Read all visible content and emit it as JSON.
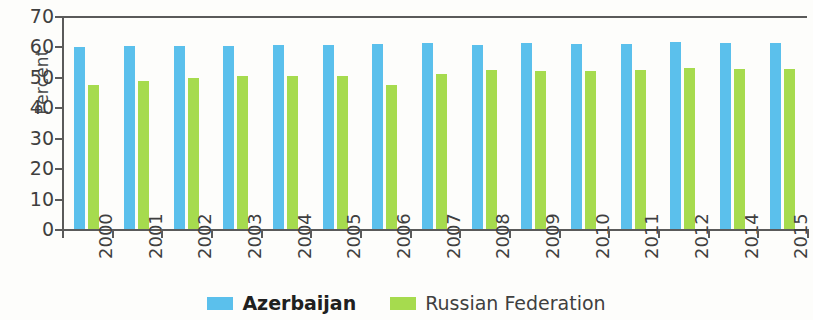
{
  "chart_data": {
    "type": "bar",
    "title": "",
    "xlabel": "",
    "ylabel": "Percent",
    "ylim": [
      0,
      70
    ],
    "yticks": [
      0,
      10,
      20,
      30,
      40,
      50,
      60,
      70
    ],
    "grid": false,
    "legend_position": "bottom-center",
    "categories": [
      "2000",
      "2001",
      "2002",
      "2003",
      "2004",
      "2005",
      "2006",
      "2007",
      "2008",
      "2009",
      "2010",
      "2011",
      "2012",
      "2014",
      "2015"
    ],
    "series": [
      {
        "name": "Azerbaijan",
        "color": "#5BC0EC",
        "values": [
          59.7,
          60.0,
          60.2,
          60.3,
          60.4,
          60.5,
          60.8,
          61.0,
          60.6,
          61.0,
          60.8,
          60.8,
          61.3,
          61.2,
          61.2
        ]
      },
      {
        "name": "Russian Federation",
        "color": "#A6DB4E",
        "values": [
          47.3,
          48.5,
          49.6,
          50.2,
          50.4,
          50.2,
          47.2,
          51.0,
          52.2,
          51.8,
          51.8,
          52.2,
          52.8,
          52.5,
          52.7
        ]
      }
    ]
  },
  "legend": {
    "items": [
      {
        "label": "Azerbaijan",
        "swatch": "blue-swatch-icon"
      },
      {
        "label": "Russian Federation",
        "swatch": "green-swatch-icon"
      }
    ]
  }
}
